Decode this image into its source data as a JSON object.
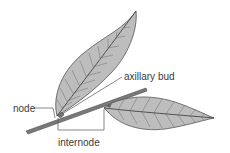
{
  "diagram": {
    "labels": {
      "node": "node",
      "axillary_bud": "axillary bud",
      "internode": "internode"
    },
    "colors": {
      "leaf_fill": "#b8b8b8",
      "leaf_vein": "#555555",
      "stem": "#6e6e6e",
      "leader_line": "#555555",
      "text": "#3a3a3a",
      "background": "#ffffff"
    }
  }
}
